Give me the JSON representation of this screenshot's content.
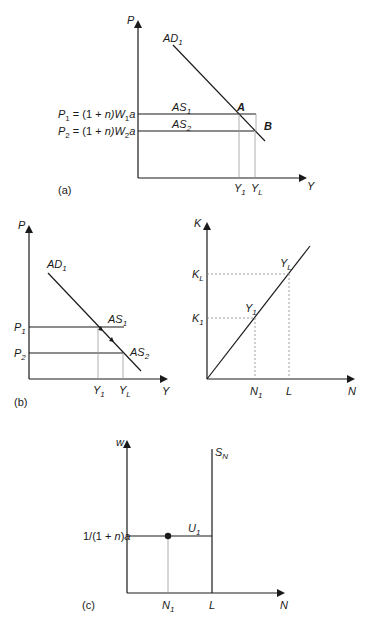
{
  "panel_a": {
    "tag": "(a)",
    "y_axis": "P",
    "x_axis": "Y",
    "ad_label": "AD",
    "ad_sub": "1",
    "as1_label": "AS",
    "as1_sub": "1",
    "as2_label": "AS",
    "as2_sub": "2",
    "point_a": "A",
    "point_b": "B",
    "p1_eq": {
      "p": "P",
      "psub": "1",
      "mid": " = (1 + ",
      "n": "n",
      "close": ")W",
      "wsub": "1",
      "a": "a"
    },
    "p2_eq": {
      "p": "P",
      "psub": "2",
      "mid": " = (1 + ",
      "n": "n",
      "close": ")W",
      "wsub": "2",
      "a": "a"
    },
    "y1": {
      "v": "Y",
      "sub": "1"
    },
    "yl": {
      "v": "Y",
      "sub": "L"
    }
  },
  "panel_b": {
    "tag": "(b)",
    "y_axis": "P",
    "x_axis": "Y",
    "ad_label": "AD",
    "ad_sub": "1",
    "as1_label": "AS",
    "as1_sub": "1",
    "as2_label": "AS",
    "as2_sub": "2",
    "p1": {
      "v": "P",
      "sub": "1"
    },
    "p2": {
      "v": "P",
      "sub": "2"
    },
    "y1": {
      "v": "Y",
      "sub": "1"
    },
    "yl": {
      "v": "Y",
      "sub": "L"
    }
  },
  "panel_kn": {
    "y_axis": "K",
    "x_axis": "N",
    "kl": {
      "v": "K",
      "sub": "L"
    },
    "k1": {
      "v": "K",
      "sub": "1"
    },
    "yl": {
      "v": "Y",
      "sub": "L"
    },
    "y1": {
      "v": "Y",
      "sub": "1"
    },
    "n1": {
      "v": "N",
      "sub": "1"
    },
    "l": "L"
  },
  "panel_c": {
    "tag": "(c)",
    "y_axis": "w",
    "x_axis": "N",
    "sn": {
      "v": "S",
      "sub": "N"
    },
    "u1": {
      "v": "U",
      "sub": "1"
    },
    "wage": {
      "pre": "1/(1 + ",
      "n": "n",
      "post": ")",
      "a": "a"
    },
    "n1": {
      "v": "N",
      "sub": "1"
    },
    "l": "L"
  }
}
